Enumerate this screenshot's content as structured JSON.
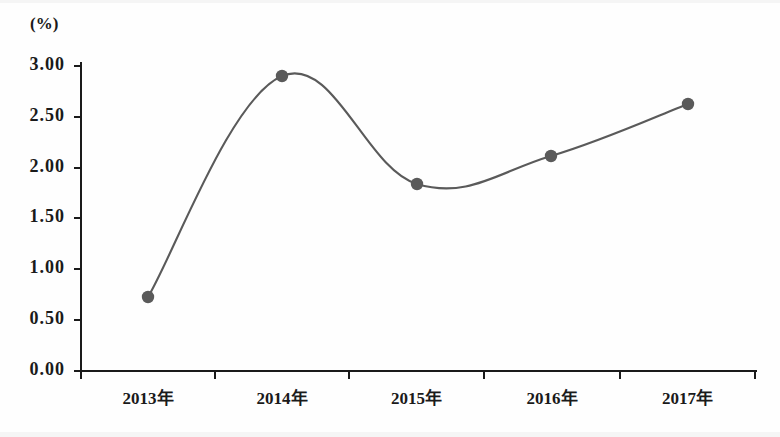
{
  "chart_data": {
    "type": "line",
    "title": "",
    "xlabel": "",
    "ylabel": "",
    "unit_label": "(%)",
    "categories": [
      "2013年",
      "2014年",
      "2015年",
      "2016年",
      "2017年"
    ],
    "values": [
      0.73,
      2.85,
      1.83,
      2.1,
      2.58
    ],
    "series": [
      {
        "name": "增长率",
        "values": [
          0.73,
          2.85,
          1.83,
          2.1,
          2.58
        ]
      }
    ],
    "ylim": [
      0.0,
      3.0
    ],
    "ytick_values": [
      0.0,
      0.5,
      1.0,
      1.5,
      2.0,
      2.5,
      3.0
    ],
    "ytick_labels": [
      "0.00",
      "0.50",
      "1.00",
      "1.50",
      "2.00",
      "2.50",
      "3.00"
    ],
    "grid": false,
    "legend": "none",
    "smooth": true,
    "marker": "circle",
    "colors": {
      "line": "#5a5a5a",
      "marker": "#5a5a5a",
      "axis": "#1a1a1a",
      "background": "#fefefe"
    }
  },
  "axes": {
    "plot_left": 81,
    "plot_right": 755,
    "plot_top": 66,
    "plot_bottom": 371,
    "point_x": [
      148,
      282,
      417,
      551,
      688
    ],
    "point_y": [
      297,
      76,
      184,
      156,
      104
    ],
    "ytick_y": [
      371,
      320,
      269,
      218,
      168,
      117,
      66
    ],
    "xtick_x": [
      81,
      215,
      349,
      484,
      620,
      755
    ]
  }
}
